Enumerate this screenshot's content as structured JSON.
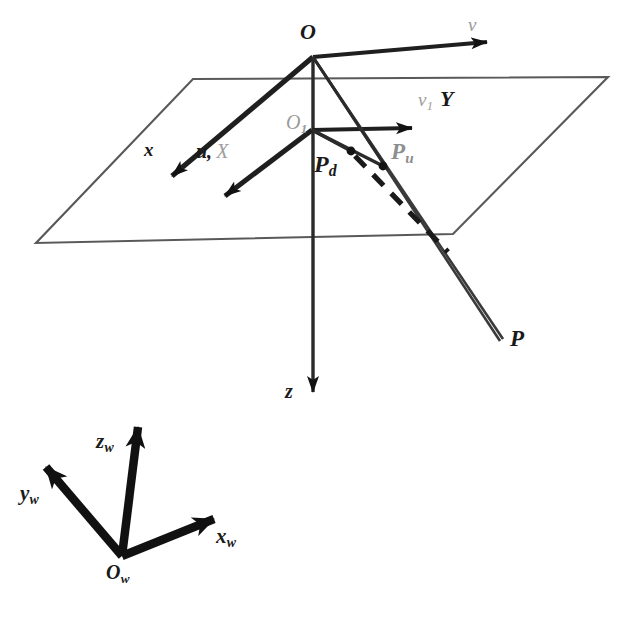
{
  "figure": {
    "background_color": "#ffffff",
    "ink_color": "#1a1a1a",
    "faint_ink_color": "#9a9a9a"
  },
  "labels": {
    "origin_O": "O",
    "axis_v": "v",
    "axis_x": "x",
    "axis_z": "z",
    "origin_O1_base": "O",
    "origin_O1_sub": "1",
    "axis_u_dark": "u,",
    "axis_X_light": "X",
    "axis_v1_base": "v",
    "axis_v1_sub": "1",
    "axis_Y": "Y",
    "point_Pd_base": "P",
    "point_Pd_sub": "d",
    "point_Pu_base": "P",
    "point_Pu_sub": "u",
    "point_P": "P",
    "world_z_base": "z",
    "world_z_sub": "w",
    "world_y_base": "y",
    "world_y_sub": "w",
    "world_x_base": "x",
    "world_x_sub": "w",
    "world_origin_base": "O",
    "world_origin_sub": "w"
  },
  "geometry": {
    "image_plane": {
      "name": "image-plane-parallelogram",
      "points": "193,79 608,77 453,234 36,243"
    },
    "optical_centre": {
      "x": 313,
      "y": 57
    },
    "principal_point": {
      "x": 312,
      "y": 130
    },
    "scene_point_P": {
      "x": 500,
      "y": 341
    },
    "point_Pd": {
      "x": 351,
      "y": 151
    },
    "point_Pu": {
      "x": 383,
      "y": 166
    },
    "axis_v_tip": {
      "x": 487,
      "y": 42
    },
    "axis_x_tip": {
      "x": 172,
      "y": 176
    },
    "axis_z_tip": {
      "x": 313,
      "y": 392
    },
    "axis_u_tip": {
      "x": 225,
      "y": 196
    },
    "axis_v1_tip": {
      "x": 412,
      "y": 128
    },
    "world_origin": {
      "x": 122,
      "y": 556
    },
    "world_z_tip": {
      "x": 138,
      "y": 427
    },
    "world_y_tip": {
      "x": 46,
      "y": 467
    },
    "world_x_tip": {
      "x": 214,
      "y": 519
    }
  }
}
